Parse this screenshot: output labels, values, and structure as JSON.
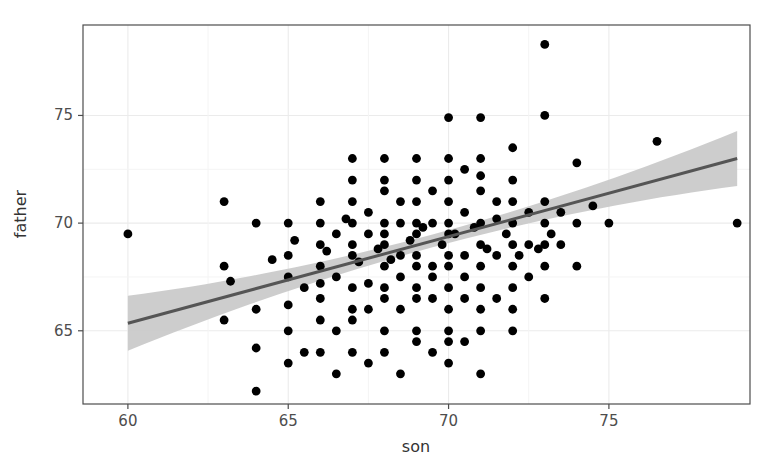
{
  "chart_data": {
    "type": "scatter",
    "title": "",
    "subtitle": "",
    "xlabel": "son",
    "ylabel": "father",
    "xlim": [
      58.6,
      79.4
    ],
    "ylim": [
      61.6,
      79.2
    ],
    "xticks": [
      60,
      65,
      70,
      75
    ],
    "yticks": [
      65,
      70,
      75
    ],
    "xtick_labels": [
      "60",
      "65",
      "70",
      "75"
    ],
    "ytick_labels": [
      "65",
      "70",
      "75"
    ],
    "grid": true,
    "grid_color": "#ebebeb",
    "legend": "none",
    "point_color": "#000000",
    "point_size": 4.4,
    "panel_border_color": "#4d4d4d",
    "panel_background": "#ffffff",
    "smooth": {
      "method": "lm",
      "line_color": "#555555",
      "ribbon_color": "#c9c9c9",
      "line_width": 3,
      "x_start": 60.0,
      "x_end": 79.0,
      "y_start": 65.35,
      "y_end": 73.0,
      "ci_lower_start": 64.1,
      "ci_upper_start": 66.6,
      "ci_lower_end": 71.7,
      "ci_upper_end": 74.3
    },
    "x": [
      60.0,
      63.0,
      63.0,
      63.0,
      63.2,
      64.0,
      64.0,
      64.0,
      64.0,
      64.5,
      65.0,
      65.0,
      65.0,
      65.0,
      65.0,
      65.0,
      65.2,
      65.5,
      65.5,
      66.0,
      66.0,
      66.0,
      66.0,
      66.0,
      66.0,
      66.0,
      66.0,
      66.2,
      66.5,
      66.5,
      66.5,
      66.5,
      66.8,
      67.0,
      67.0,
      67.0,
      67.0,
      67.0,
      67.0,
      67.0,
      67.0,
      67.0,
      67.0,
      67.2,
      67.5,
      67.5,
      67.5,
      67.5,
      67.5,
      67.8,
      68.0,
      68.0,
      68.0,
      68.0,
      68.0,
      68.0,
      68.0,
      68.0,
      68.0,
      68.0,
      68.0,
      68.2,
      68.5,
      68.5,
      68.5,
      68.5,
      68.5,
      68.5,
      68.8,
      69.0,
      69.0,
      69.0,
      69.0,
      69.0,
      69.0,
      69.0,
      69.0,
      69.0,
      69.0,
      69.0,
      69.2,
      69.5,
      69.5,
      69.5,
      69.5,
      69.5,
      69.5,
      69.8,
      70.0,
      70.0,
      70.0,
      70.0,
      70.0,
      70.0,
      70.0,
      70.0,
      70.0,
      70.0,
      70.0,
      70.0,
      70.0,
      70.2,
      70.5,
      70.5,
      70.5,
      70.5,
      70.5,
      70.5,
      70.8,
      71.0,
      71.0,
      71.0,
      71.0,
      71.0,
      71.0,
      71.0,
      71.0,
      71.0,
      71.0,
      71.0,
      71.2,
      71.5,
      71.5,
      71.5,
      71.5,
      71.8,
      72.0,
      72.0,
      72.0,
      72.0,
      72.0,
      72.0,
      72.0,
      72.0,
      72.0,
      72.2,
      72.5,
      72.5,
      72.5,
      72.8,
      73.0,
      73.0,
      73.0,
      73.0,
      73.0,
      73.0,
      73.0,
      73.2,
      73.5,
      73.5,
      74.0,
      74.0,
      74.0,
      74.5,
      75.0,
      76.5,
      79.0
    ],
    "y": [
      69.5,
      68.0,
      71.0,
      65.5,
      67.3,
      66.0,
      64.2,
      62.2,
      70.0,
      68.3,
      67.5,
      65.0,
      70.0,
      68.5,
      63.5,
      66.2,
      69.2,
      67.0,
      64.0,
      70.0,
      68.0,
      66.5,
      64.0,
      69.0,
      67.2,
      71.0,
      65.5,
      68.7,
      69.5,
      67.5,
      65.0,
      63.0,
      70.2,
      70.0,
      68.5,
      67.0,
      65.5,
      69.0,
      71.0,
      73.0,
      66.0,
      72.0,
      64.0,
      68.2,
      69.5,
      67.2,
      70.5,
      66.0,
      63.5,
      68.8,
      70.0,
      68.0,
      66.5,
      69.5,
      71.5,
      67.0,
      65.0,
      73.0,
      72.0,
      64.0,
      69.0,
      68.3,
      70.0,
      68.5,
      66.0,
      71.0,
      67.5,
      63.0,
      69.2,
      70.0,
      68.0,
      66.5,
      72.0,
      69.5,
      67.0,
      71.0,
      65.0,
      73.0,
      64.5,
      68.5,
      69.8,
      70.0,
      68.0,
      66.5,
      71.5,
      67.5,
      64.0,
      69.0,
      70.0,
      68.0,
      66.0,
      72.0,
      69.5,
      67.0,
      71.0,
      65.0,
      73.0,
      74.9,
      63.5,
      64.5,
      68.5,
      69.5,
      70.5,
      68.5,
      66.5,
      72.5,
      67.5,
      64.5,
      69.8,
      70.0,
      68.0,
      66.0,
      71.5,
      69.0,
      67.0,
      73.0,
      72.2,
      65.0,
      63.0,
      74.9,
      68.8,
      70.2,
      68.5,
      66.5,
      71.0,
      69.5,
      70.0,
      68.0,
      66.0,
      72.0,
      69.0,
      67.0,
      71.0,
      65.0,
      73.5,
      68.5,
      70.5,
      69.0,
      67.5,
      68.8,
      70.0,
      68.0,
      71.0,
      69.0,
      66.5,
      75.0,
      78.3,
      69.5,
      70.5,
      69.0,
      70.0,
      68.0,
      72.8,
      70.8,
      70.0,
      73.8,
      70.0
    ]
  }
}
